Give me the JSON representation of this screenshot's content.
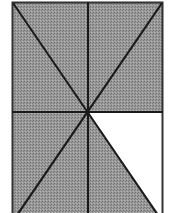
{
  "diagram": {
    "shaded_color": "#8c8c8c",
    "unshaded_color": "#ffffff",
    "line_color": "#1a1a1a",
    "regions_total": 8,
    "regions_shaded": 7,
    "regions_unshaded": 1
  }
}
